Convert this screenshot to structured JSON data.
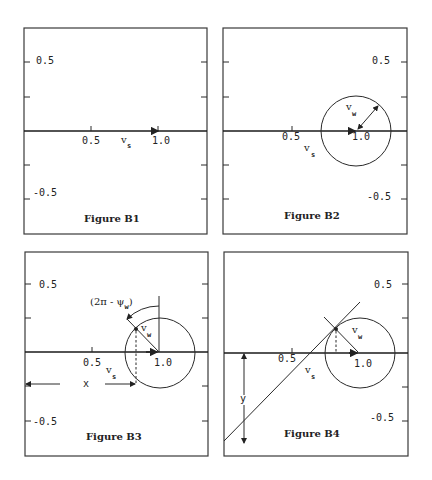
{
  "panels": [
    {
      "id": "B1",
      "caption": "Figure B1",
      "x_ticks": [
        "0.5",
        "1.0"
      ],
      "y_ticks": [
        "0.5",
        "-0.5"
      ],
      "x_symbol": "v",
      "x_symbol_sub": "s"
    },
    {
      "id": "B2",
      "caption": "Figure B2",
      "x_ticks": [
        "0.5",
        "1.0"
      ],
      "y_ticks": [
        "0.5",
        "-0.5"
      ],
      "x_symbol": "v",
      "x_symbol_sub": "s",
      "radius_symbol": "v",
      "radius_symbol_sub": "w"
    },
    {
      "id": "B3",
      "caption": "Figure B3",
      "x_ticks": [
        "0.5",
        "1.0"
      ],
      "y_ticks": [
        "0.5",
        "-0.5"
      ],
      "x_symbol": "v",
      "x_symbol_sub": "s",
      "radius_symbol": "v",
      "radius_symbol_sub": "w",
      "angle_label": "(2π - ψ",
      "angle_label_sub": "w",
      "angle_label_close": ")",
      "distance_label": "x"
    },
    {
      "id": "B4",
      "caption": "Figure B4",
      "x_ticks": [
        "0.5",
        "1.0"
      ],
      "y_ticks": [
        "0.5",
        "-0.5"
      ],
      "x_symbol": "v",
      "x_symbol_sub": "s",
      "radius_symbol": "v",
      "radius_symbol_sub": "w",
      "distance_label": "y"
    }
  ]
}
